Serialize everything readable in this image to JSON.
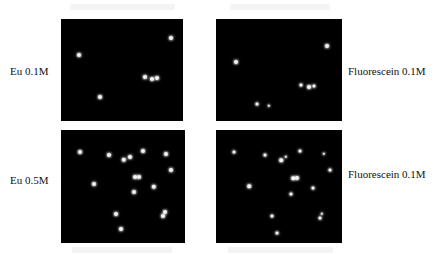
{
  "figure": {
    "panels": [
      {
        "id": "eu-0.1",
        "label": "Eu 0.1M",
        "box": {
          "x": 61,
          "y": 19,
          "w": 122,
          "h": 102
        },
        "label_pos": {
          "x": 10,
          "y": 71
        },
        "spots": [
          {
            "x": 79,
            "y": 55,
            "r": 2
          },
          {
            "x": 171,
            "y": 38,
            "r": 2
          },
          {
            "x": 145,
            "y": 77,
            "r": 2
          },
          {
            "x": 152,
            "y": 79,
            "r": 2
          },
          {
            "x": 157,
            "y": 78,
            "r": 2
          },
          {
            "x": 100,
            "y": 97,
            "r": 2
          }
        ]
      },
      {
        "id": "fluorescein-0.1-top",
        "label": "Fluorescein 0.1M",
        "box": {
          "x": 216,
          "y": 19,
          "w": 126,
          "h": 102
        },
        "label_pos": {
          "x": 348,
          "y": 71
        },
        "spots": [
          {
            "x": 327,
            "y": 46,
            "r": 2
          },
          {
            "x": 236,
            "y": 62,
            "r": 2
          },
          {
            "x": 301,
            "y": 85,
            "r": 1.5
          },
          {
            "x": 309,
            "y": 87,
            "r": 2
          },
          {
            "x": 314,
            "y": 86,
            "r": 1.5
          },
          {
            "x": 257,
            "y": 104,
            "r": 1.5
          },
          {
            "x": 269,
            "y": 106,
            "r": 1.2
          }
        ]
      },
      {
        "id": "eu-0.5",
        "label": "Eu 0.5M",
        "box": {
          "x": 61,
          "y": 130,
          "w": 124,
          "h": 113
        },
        "label_pos": {
          "x": 10,
          "y": 180
        },
        "spots": [
          {
            "x": 80,
            "y": 152,
            "r": 2
          },
          {
            "x": 109,
            "y": 155,
            "r": 2
          },
          {
            "x": 124,
            "y": 160,
            "r": 2.2
          },
          {
            "x": 130,
            "y": 157,
            "r": 2
          },
          {
            "x": 143,
            "y": 151,
            "r": 2
          },
          {
            "x": 166,
            "y": 154,
            "r": 2
          },
          {
            "x": 171,
            "y": 170,
            "r": 2
          },
          {
            "x": 135,
            "y": 177,
            "r": 2
          },
          {
            "x": 139,
            "y": 177,
            "r": 2
          },
          {
            "x": 94,
            "y": 184,
            "r": 2
          },
          {
            "x": 154,
            "y": 187,
            "r": 2.2
          },
          {
            "x": 134,
            "y": 192,
            "r": 2
          },
          {
            "x": 116,
            "y": 214,
            "r": 2
          },
          {
            "x": 165,
            "y": 212,
            "r": 2
          },
          {
            "x": 163,
            "y": 216,
            "r": 2
          },
          {
            "x": 121,
            "y": 229,
            "r": 2
          }
        ]
      },
      {
        "id": "fluorescein-0.1-bottom",
        "label": "Fluorescein 0.1M",
        "box": {
          "x": 216,
          "y": 130,
          "w": 126,
          "h": 113
        },
        "label_pos": {
          "x": 348,
          "y": 174
        },
        "spots": [
          {
            "x": 234,
            "y": 152,
            "r": 1.5
          },
          {
            "x": 265,
            "y": 155,
            "r": 1.5
          },
          {
            "x": 281,
            "y": 160,
            "r": 1.8
          },
          {
            "x": 286,
            "y": 157,
            "r": 1.2
          },
          {
            "x": 300,
            "y": 151,
            "r": 1.5
          },
          {
            "x": 324,
            "y": 154,
            "r": 1.2
          },
          {
            "x": 330,
            "y": 170,
            "r": 1.5
          },
          {
            "x": 293,
            "y": 178,
            "r": 1.8
          },
          {
            "x": 297,
            "y": 178,
            "r": 2
          },
          {
            "x": 249,
            "y": 186,
            "r": 1.8
          },
          {
            "x": 313,
            "y": 188,
            "r": 1.5
          },
          {
            "x": 291,
            "y": 194,
            "r": 1.5
          },
          {
            "x": 272,
            "y": 216,
            "r": 1.5
          },
          {
            "x": 322,
            "y": 214,
            "r": 1.2
          },
          {
            "x": 320,
            "y": 218,
            "r": 1.5
          },
          {
            "x": 277,
            "y": 233,
            "r": 1.5
          }
        ]
      }
    ],
    "colors": {
      "background": "#ffffff",
      "panel": "#000000",
      "spot": "#f4f4f4",
      "text": "#111111"
    }
  }
}
